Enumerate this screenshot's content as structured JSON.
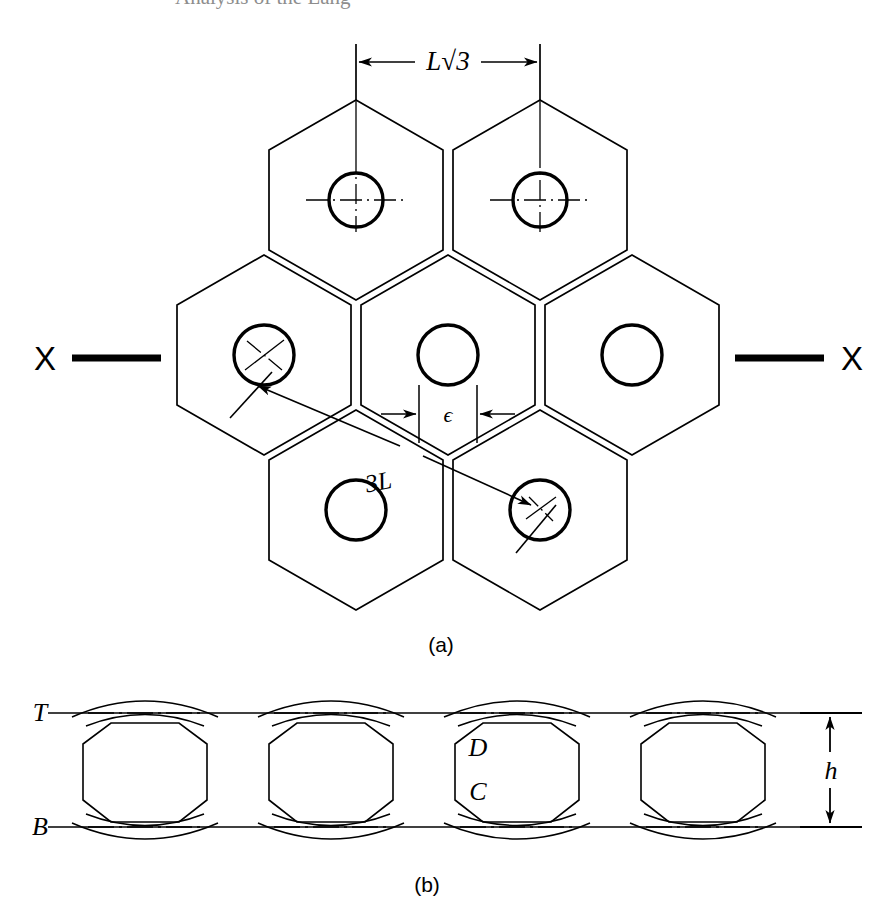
{
  "page": {
    "header_fragment": "Analysis of the Lang",
    "background_color": "#ffffff",
    "ink_color": "#000000",
    "width": 882,
    "height": 913
  },
  "figure_a": {
    "caption": "(a)",
    "description": "Plan view of hexagonal honeycomb cell array with circular holes",
    "dimension_pitch_label": "L√3",
    "dimension_gap_label": "ϵ",
    "dimension_diagonal_label": "3L",
    "section_label_left": "X",
    "section_label_right": "X",
    "hexagon_count": 7,
    "circle_count": 7
  },
  "figure_b": {
    "caption": "(b)",
    "description": "Section X-X elevation through the cell row",
    "label_top_line": "T",
    "label_bottom_line": "B",
    "label_depth_upper": "D",
    "label_depth_lower": "C",
    "dimension_height_label": "h",
    "cell_count": 4
  }
}
